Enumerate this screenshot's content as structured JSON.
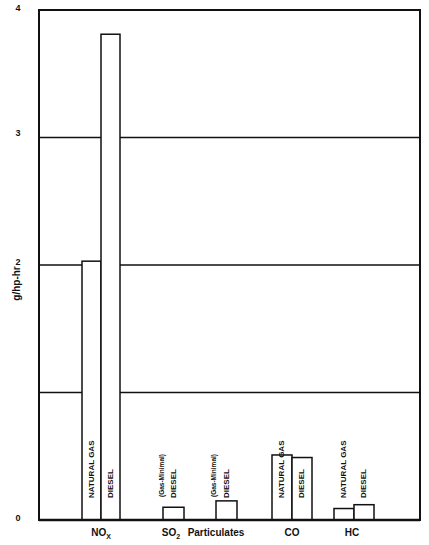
{
  "chart_data": {
    "type": "bar",
    "title": "",
    "xlabel": "",
    "ylabel": "g/hp-hr",
    "ylim": [
      0,
      4
    ],
    "yticks_labeled": [
      "0",
      "2",
      "3",
      "4"
    ],
    "gridlines": [
      1,
      2,
      3
    ],
    "grid": true,
    "categories": [
      "NOx",
      "SO2",
      "Particulates",
      "CO",
      "HC"
    ],
    "category_labels": [
      {
        "main": "NO",
        "sub": "X"
      },
      {
        "main": "SO",
        "sub": "2"
      },
      {
        "main": "Particulates",
        "sub": ""
      },
      {
        "main": "CO",
        "sub": ""
      },
      {
        "main": "HC",
        "sub": ""
      }
    ],
    "series": [
      {
        "name": "NATURAL GAS",
        "values": [
          2.03,
          0,
          0,
          0.51,
          0.09
        ]
      },
      {
        "name": "DIESEL",
        "values": [
          3.81,
          0.1,
          0.15,
          0.49,
          0.12
        ]
      }
    ],
    "bar_labels": [
      {
        "ng": "NATURAL GAS",
        "diesel": "DIESEL"
      },
      {
        "ng": "(Gas-Minimal)",
        "diesel": "DIESEL"
      },
      {
        "ng": "(Gas-Minimal)",
        "diesel": "DIESEL"
      },
      {
        "ng": "NATURAL GAS",
        "diesel": "DIESEL"
      },
      {
        "ng": "NATURAL GAS",
        "diesel": "DIESEL"
      }
    ]
  },
  "axis": {
    "ylabel": "g/hp-hr",
    "ticks": {
      "t0": "0",
      "t2": "2",
      "t3": "3",
      "t4": "4"
    }
  },
  "colors": {
    "line": "#111111",
    "background": "#ffffff"
  }
}
